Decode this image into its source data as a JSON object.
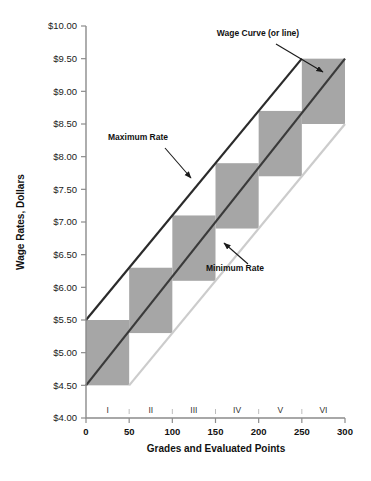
{
  "chart_data": {
    "type": "bar",
    "title": "",
    "xlabel": "Grades and Evaluated Points",
    "ylabel": "Wage Rates, Dollars",
    "xlim": [
      0,
      300
    ],
    "ylim": [
      4.0,
      10.0
    ],
    "grid": false,
    "legend_position": "none",
    "x_ticks": [
      "0",
      "50",
      "100",
      "150",
      "200",
      "250",
      "300"
    ],
    "x_tick_values": [
      0,
      50,
      100,
      150,
      200,
      250,
      300
    ],
    "y_ticks": [
      "$4.00",
      "$4.50",
      "$5.00",
      "$5.50",
      "$6.00",
      "$6.50",
      "$7.00",
      "$7.50",
      "$8.00",
      "$8.50",
      "$9.00",
      "$9.50",
      "$10.00"
    ],
    "y_tick_values": [
      4.0,
      4.5,
      5.0,
      5.5,
      6.0,
      6.5,
      7.0,
      7.5,
      8.0,
      8.5,
      9.0,
      9.5,
      10.0
    ],
    "grade_bands": [
      {
        "label": "I",
        "x_start": 0,
        "x_end": 50,
        "rate_min": 4.5,
        "rate_max": 5.5
      },
      {
        "label": "II",
        "x_start": 50,
        "x_end": 100,
        "rate_min": 5.3,
        "rate_max": 6.3
      },
      {
        "label": "III",
        "x_start": 100,
        "x_end": 150,
        "rate_min": 6.1,
        "rate_max": 7.1
      },
      {
        "label": "IV",
        "x_start": 150,
        "x_end": 200,
        "rate_min": 6.9,
        "rate_max": 7.9
      },
      {
        "label": "V",
        "x_start": 200,
        "x_end": 250,
        "rate_min": 7.7,
        "rate_max": 8.7
      },
      {
        "label": "VI",
        "x_start": 250,
        "x_end": 300,
        "rate_min": 8.5,
        "rate_max": 9.5
      }
    ],
    "series": [
      {
        "name": "Maximum Rate",
        "style": "line",
        "color": "#2b2b2b",
        "points": [
          {
            "x": 0,
            "y": 5.5
          },
          {
            "x": 250,
            "y": 9.5
          }
        ]
      },
      {
        "name": "Wage Curve (or line)",
        "style": "line",
        "color": "#3a3a3a",
        "points": [
          {
            "x": 0,
            "y": 4.5
          },
          {
            "x": 300,
            "y": 9.5
          }
        ]
      },
      {
        "name": "Minimum Rate",
        "style": "line",
        "color": "#cccccc",
        "points": [
          {
            "x": 50,
            "y": 4.5
          },
          {
            "x": 300,
            "y": 8.5
          }
        ]
      }
    ],
    "annotations": [
      {
        "id": "wage-curve",
        "text": "Wage Curve (or line)",
        "text_x": 258,
        "text_y": 36,
        "arrow_from_x": 276,
        "arrow_from_y": 44,
        "arrow_to_x": 323,
        "arrow_to_y": 72
      },
      {
        "id": "maximum-rate",
        "text": "Maximum Rate",
        "text_x": 138,
        "text_y": 140,
        "arrow_from_x": 165,
        "arrow_from_y": 148,
        "arrow_to_x": 191,
        "arrow_to_y": 178
      },
      {
        "id": "minimum-rate",
        "text": "Minimum Rate",
        "text_x": 235,
        "text_y": 271,
        "arrow_from_x": 248,
        "arrow_from_y": 264,
        "arrow_to_x": 224,
        "arrow_to_y": 243
      }
    ],
    "bar_fill_color": "#a6a6a6",
    "axis_color": "#8c8c8c"
  }
}
